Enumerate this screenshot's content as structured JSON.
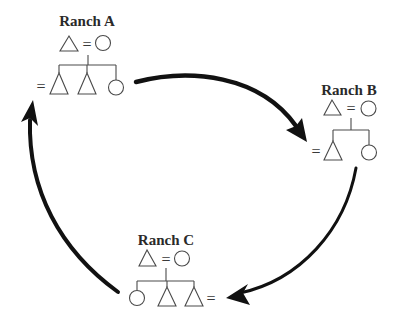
{
  "diagram": {
    "type": "kinship-exchange-cycle",
    "ranches": [
      {
        "id": "A",
        "label": "Ranch A",
        "parents": [
          "male",
          "female"
        ],
        "parent_link": "=",
        "children": [
          "male",
          "male",
          "female"
        ],
        "child_marriage_marker": "=",
        "marked_child_index": 0
      },
      {
        "id": "B",
        "label": "Ranch B",
        "parents": [
          "male",
          "female"
        ],
        "parent_link": "=",
        "children": [
          "male",
          "female"
        ],
        "child_marriage_marker": "=",
        "marked_child_index": 0
      },
      {
        "id": "C",
        "label": "Ranch C",
        "parents": [
          "male",
          "female"
        ],
        "parent_link": "=",
        "children": [
          "female",
          "male",
          "male"
        ],
        "child_marriage_marker": "=",
        "marked_child_index": 2
      }
    ],
    "arrows": [
      {
        "from": "Ranch A",
        "to": "Ranch B"
      },
      {
        "from": "Ranch B",
        "to": "Ranch C"
      },
      {
        "from": "Ranch C",
        "to": "Ranch A"
      }
    ],
    "legend_symbols": {
      "triangle": "male",
      "circle": "female",
      "equals": "marriage"
    },
    "colors": {
      "arrow": "#111111",
      "symbol_stroke": "#4a4a4a",
      "text": "#2a2a2a",
      "background": "#ffffff"
    }
  }
}
